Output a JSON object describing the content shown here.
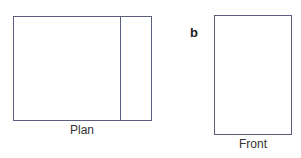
{
  "diagram": {
    "stroke_color": "#5a5f80",
    "panel_label": "b",
    "plan": {
      "label": "Plan",
      "rect": {
        "x": 13,
        "y": 16,
        "w": 138,
        "h": 104
      },
      "divider_x": 120
    },
    "front": {
      "label": "Front",
      "rect": {
        "x": 214,
        "y": 15,
        "w": 77,
        "h": 119
      }
    }
  }
}
